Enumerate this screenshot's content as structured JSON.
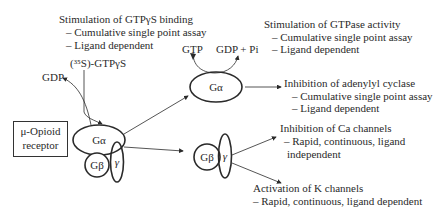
{
  "receptor": {
    "line1": "μ-Opioid",
    "line2": "receptor"
  },
  "g_protein": {
    "alpha": "Gα",
    "beta": "Gβ",
    "gamma": "γ"
  },
  "inputs": {
    "gdp": "GDP",
    "gtpgs": "(³⁵S)-GTPγS"
  },
  "gtp_cycle": {
    "gtp": "GTP",
    "gdp_pi": "GDP + Pi"
  },
  "effects": {
    "gtpgs_binding": {
      "title": "Stimulation of GTPγS binding",
      "items": [
        "– Cumulative single point assay",
        "– Ligand dependent"
      ]
    },
    "gtpase": {
      "title": "Stimulation of GTPase activity",
      "items": [
        "– Cumulative single point assay",
        "– Ligand dependent"
      ]
    },
    "adenylyl_cyclase": {
      "title": "Inhibition of adenylyl cyclase",
      "items": [
        "– Cumulative single point assay",
        "– Ligand dependent"
      ]
    },
    "ca_channels": {
      "title": "Inhibition of Ca channels",
      "items": [
        "– Rapid, continuous, ligand",
        "independent"
      ]
    },
    "k_channels": {
      "title": "Activation of K channels",
      "items": [
        "– Rapid, continuous, ligand dependent"
      ]
    }
  },
  "colors": {
    "stroke": "#2a2a2a",
    "background": "#ffffff"
  }
}
